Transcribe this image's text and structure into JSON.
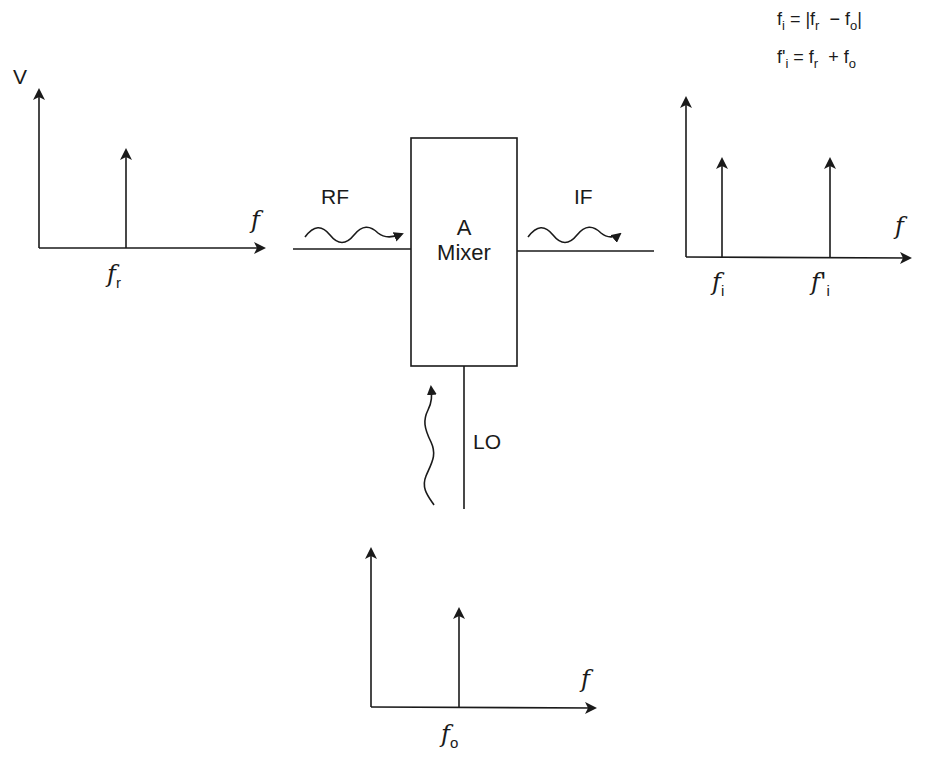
{
  "equations": {
    "difference": {
      "lhs": "f",
      "lhs_sub": "i",
      "eq": " = |f",
      "a_sub": "r",
      "op": "  − f",
      "b_sub": "o",
      "close": "|"
    },
    "sum": {
      "lhs": "f'",
      "lhs_sub": "i",
      "eq": " = f",
      "a_sub": "r",
      "op": "  + f",
      "b_sub": "o"
    }
  },
  "mixer": {
    "line1": "A",
    "line2": "Mixer"
  },
  "ports": {
    "rf": "RF",
    "if": "IF",
    "lo": "LO"
  },
  "input_spectrum": {
    "y_axis_label": "V",
    "x_axis_label": "f",
    "spikes": [
      {
        "label": "f",
        "sub": "r"
      }
    ]
  },
  "output_spectrum": {
    "x_axis_label": "f",
    "spikes": [
      {
        "label": "f",
        "sub": "i"
      },
      {
        "label": "f'",
        "sub": "i"
      }
    ]
  },
  "lo_spectrum": {
    "x_axis_label": "f",
    "spikes": [
      {
        "label": "f",
        "sub": "o"
      }
    ]
  },
  "colors": {
    "ink": "#1a1a1a",
    "background": "#ffffff"
  }
}
